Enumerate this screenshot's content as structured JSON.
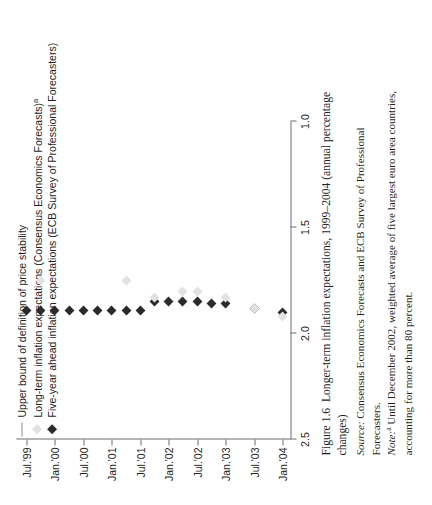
{
  "figure": {
    "caption_label": "Figure 1.6",
    "caption_title": "Longer-term inflation expectations, 1999–2004 (annual percentage changes)",
    "source_label": "Source:",
    "source_text": "Consensus Economics Forecasts and ECB Survey of Professional Forecasters.",
    "note_label": "Note:",
    "note_marker": "a",
    "note_text": "Until December 2002, weighted average of five largest euro area countries, accounting for more than 80 percent."
  },
  "legend": {
    "items": [
      {
        "key": "line",
        "label": "Upper bound of definition of price stability",
        "color": "#8a8a8a"
      },
      {
        "key": "light-diamond",
        "label": "Long-term inflation expectations (Consensus Economics Forecasts)",
        "marker_suffix": "a",
        "color": "#e0e0e0"
      },
      {
        "key": "dark-diamond",
        "label": "Five-year ahead inflation expectations (ECB Survey of Professional Forecasters)",
        "color": "#2b2b2b"
      }
    ]
  },
  "chart_data": {
    "type": "scatter",
    "title": "Longer-term inflation expectations, 1999–2004 (annual percentage changes)",
    "xlabel": "",
    "ylabel": "",
    "ylim": [
      1.0,
      2.5
    ],
    "yticks": [
      "2.5",
      "2.0",
      "1.5",
      "1.0"
    ],
    "ytick_values": [
      2.5,
      2.0,
      1.5,
      1.0
    ],
    "y_axis_inverted": true,
    "grid": false,
    "legend_position": "top-left",
    "xticks": [
      "Jul.'99",
      "Jan.'00",
      "Jul.'00",
      "Jan.'01",
      "Jul.'01",
      "Jan.'02",
      "Jul.'02",
      "Jan.'03",
      "Jul.'03",
      "Jan.'04"
    ],
    "reference_line": {
      "label": "Upper bound of definition of price stability",
      "value": 2.0
    },
    "series": [
      {
        "name": "Five-year ahead inflation expectations (ECB Survey of Professional Forecasters)",
        "marker": "diamond",
        "color": "#2b2b2b",
        "points": [
          {
            "x": "Jul.'99",
            "y": 1.89
          },
          {
            "x": "Oct.'99",
            "y": 1.89
          },
          {
            "x": "Jan.'00",
            "y": 1.89
          },
          {
            "x": "Apr.'00",
            "y": 1.89
          },
          {
            "x": "Jul.'00",
            "y": 1.89
          },
          {
            "x": "Oct.'00",
            "y": 1.89
          },
          {
            "x": "Jan.'01",
            "y": 1.89
          },
          {
            "x": "Apr.'01",
            "y": 1.89
          },
          {
            "x": "Jul.'01",
            "y": 1.89
          },
          {
            "x": "Oct.'01",
            "y": 1.85
          },
          {
            "x": "Jan.'02",
            "y": 1.85
          },
          {
            "x": "Apr.'02",
            "y": 1.85
          },
          {
            "x": "Jul.'02",
            "y": 1.85
          },
          {
            "x": "Oct.'02",
            "y": 1.86
          },
          {
            "x": "Jan.'03",
            "y": 1.86
          },
          {
            "x": "Jul.'03",
            "y": 1.88
          },
          {
            "x": "Jan.'04",
            "y": 1.9
          }
        ]
      },
      {
        "name": "Long-term inflation expectations (Consensus Economics Forecasts)",
        "marker": "diamond",
        "color": "#e2e2e2",
        "points": [
          {
            "x": "Oct.'99",
            "y": 1.75
          },
          {
            "x": "Apr.'01",
            "y": 1.75
          },
          {
            "x": "Oct.'01",
            "y": 1.83
          },
          {
            "x": "Apr.'02",
            "y": 1.8
          },
          {
            "x": "Jul.'02",
            "y": 1.8
          },
          {
            "x": "Jan.'03",
            "y": 1.83
          },
          {
            "x": "Jul.'03",
            "y": 1.88
          },
          {
            "x": "Jan.'04",
            "y": 1.92
          }
        ]
      }
    ]
  }
}
